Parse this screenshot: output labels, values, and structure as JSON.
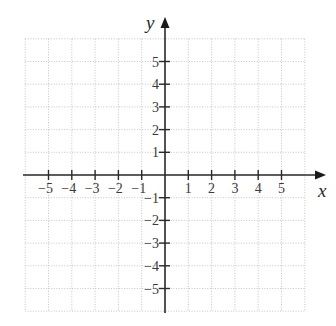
{
  "chart_data": {
    "type": "line",
    "title": "",
    "subtitle": "",
    "xlabel": "x",
    "ylabel": "y",
    "xlim": [
      -6,
      6
    ],
    "ylim": [
      -6,
      6
    ],
    "grid": true,
    "grid_style": "dotted",
    "legend": null,
    "x_ticks": [
      -5,
      -4,
      -3,
      -2,
      -1,
      1,
      2,
      3,
      4,
      5
    ],
    "x_tick_labels": [
      "−5",
      "−4",
      "−3",
      "−2",
      "−1",
      "1",
      "2",
      "3",
      "4",
      "5"
    ],
    "y_ticks": [
      5,
      4,
      3,
      2,
      1,
      -1,
      -2,
      -3,
      -4,
      -5
    ],
    "y_tick_labels": [
      "5",
      "4",
      "3",
      "2",
      "1",
      "−1",
      "−2",
      "−3",
      "−4",
      "−5"
    ],
    "series": []
  },
  "colors": {
    "axis": "#2a2a2a",
    "grid": "#b8b8b8",
    "labels": "#3a3a3a",
    "background": "#ffffff"
  },
  "layout": {
    "origin_x": 165,
    "origin_y": 175,
    "unit_x": 23.3,
    "unit_y": 22.7,
    "grid_min": -6,
    "grid_max": 6,
    "x_axis_left": 23,
    "x_axis_arrow_tip": 326,
    "y_axis_bottom": 313,
    "y_axis_arrow_tip": 17
  }
}
